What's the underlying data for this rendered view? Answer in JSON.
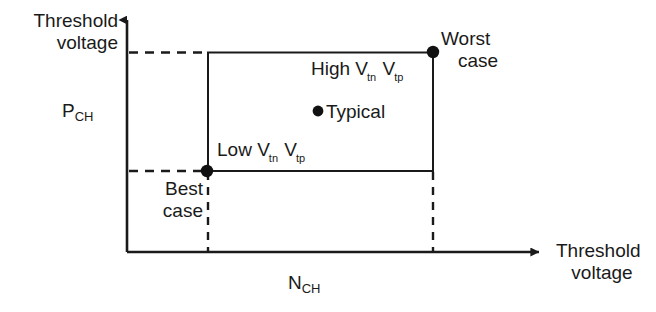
{
  "figure": {
    "type": "process-corner-diagram",
    "background_color": "#ffffff",
    "line_color": "#1a1a1a",
    "axes": {
      "y_axis_title_line1": "Threshold",
      "y_axis_title_line2": "voltage",
      "x_axis_title_line1": "Threshold",
      "x_axis_title_line2": "voltage",
      "y_axis_variable": "P",
      "y_axis_variable_subscript": "CH",
      "x_axis_variable": "N",
      "x_axis_variable_subscript": "CH"
    },
    "annotations": {
      "high_corner_prefix": "High V",
      "high_corner_sub1": "t",
      "high_corner_sub1b": "n",
      "high_corner_mid": " V",
      "high_corner_sub2": "t",
      "high_corner_sub2b": "p",
      "low_corner_prefix": "Low V",
      "low_corner_sub1": "t",
      "low_corner_sub1b": "n",
      "low_corner_mid": " V",
      "low_corner_sub2": "t",
      "low_corner_sub2b": "p",
      "typical_label": "Typical",
      "worst_case_line1": "Worst",
      "worst_case_line2": "case",
      "best_case_line1": "Best",
      "best_case_line2": "case"
    },
    "points": [
      {
        "name": "worst-case-point",
        "x": 433,
        "y": 52
      },
      {
        "name": "typical-point",
        "x": 318,
        "y": 112
      },
      {
        "name": "best-case-point",
        "x": 207,
        "y": 171
      }
    ],
    "box": {
      "left": 208,
      "right": 433,
      "top": 52,
      "bottom": 171
    }
  }
}
